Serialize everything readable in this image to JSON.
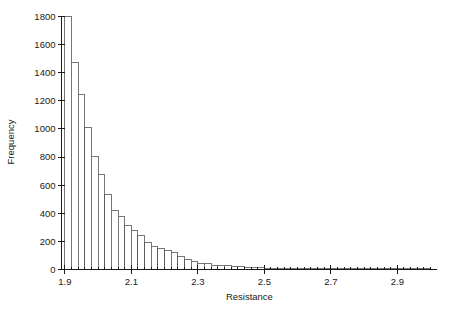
{
  "chart_data": {
    "type": "bar",
    "title": "",
    "subtitle": "",
    "xlabel": "Resistance",
    "ylabel": "Frequency",
    "xlim": [
      1.89,
      3.01
    ],
    "ylim": [
      0,
      1800
    ],
    "grid": false,
    "legend": null,
    "xticks": [
      1.9,
      2.1,
      2.3,
      2.5,
      2.7,
      2.9
    ],
    "xtick_labels": [
      "1.9",
      "2.1",
      "2.3",
      "2.5",
      "2.7",
      "2.9"
    ],
    "xticks_minor_step": 0.02,
    "yticks": [
      0,
      200,
      400,
      600,
      800,
      1000,
      1200,
      1400,
      1600,
      1800
    ],
    "ytick_labels": [
      "0",
      "200",
      "400",
      "600",
      "800",
      "1000",
      "1200",
      "1400",
      "1600",
      "1800"
    ],
    "bin_width": 0.02,
    "bin_starts": [
      1.9,
      1.92,
      1.94,
      1.96,
      1.98,
      2.0,
      2.02,
      2.04,
      2.06,
      2.08,
      2.1,
      2.12,
      2.14,
      2.16,
      2.18,
      2.2,
      2.22,
      2.24,
      2.26,
      2.28,
      2.3,
      2.32,
      2.34,
      2.36,
      2.38,
      2.4,
      2.42,
      2.44,
      2.46,
      2.48,
      2.5,
      2.52,
      2.54,
      2.56,
      2.58,
      2.6,
      2.62,
      2.64,
      2.66,
      2.68,
      2.7,
      2.72,
      2.74,
      2.76,
      2.78,
      2.8,
      2.82,
      2.84,
      2.86,
      2.88,
      2.9,
      2.92,
      2.94,
      2.96,
      2.98
    ],
    "categories": [
      "1.90",
      "1.92",
      "1.94",
      "1.96",
      "1.98",
      "2.00",
      "2.02",
      "2.04",
      "2.06",
      "2.08",
      "2.10",
      "2.12",
      "2.14",
      "2.16",
      "2.18",
      "2.20",
      "2.22",
      "2.24",
      "2.26",
      "2.28",
      "2.30",
      "2.32",
      "2.34",
      "2.36",
      "2.38",
      "2.40",
      "2.42",
      "2.44",
      "2.46",
      "2.48",
      "2.50",
      "2.52",
      "2.54",
      "2.56",
      "2.58",
      "2.60",
      "2.62",
      "2.64",
      "2.66",
      "2.68",
      "2.70",
      "2.72",
      "2.74",
      "2.76",
      "2.78",
      "2.80",
      "2.82",
      "2.84",
      "2.86",
      "2.88",
      "2.90",
      "2.92",
      "2.94",
      "2.96",
      "2.98"
    ],
    "values": [
      1800,
      1470,
      1245,
      1010,
      805,
      675,
      535,
      420,
      380,
      310,
      275,
      240,
      195,
      165,
      150,
      135,
      120,
      90,
      72,
      60,
      45,
      40,
      32,
      28,
      25,
      22,
      18,
      15,
      13,
      12,
      10,
      9,
      8,
      7,
      6,
      6,
      5,
      5,
      4,
      4,
      4,
      3,
      3,
      3,
      2,
      2,
      2,
      2,
      2,
      2,
      2,
      1,
      1,
      1,
      1
    ]
  },
  "colors": {
    "axis": "#1a1a1a",
    "bar_stroke": "#555555",
    "bar_fill": "#ffffff",
    "background": "#ffffff"
  }
}
